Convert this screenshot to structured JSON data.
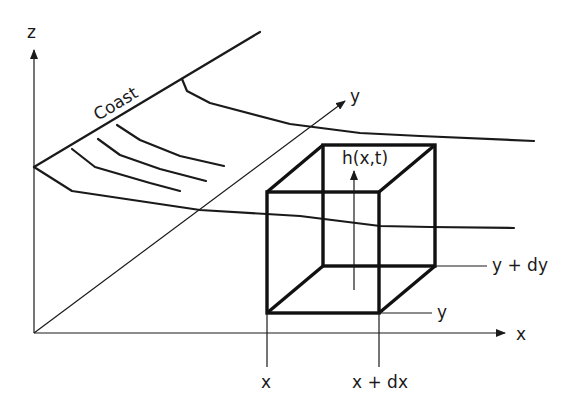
{
  "diagram": {
    "type": "control-volume-schematic",
    "axes": {
      "z_label": "z",
      "x_label": "x",
      "y_label": "y"
    },
    "coast_label": "Coast",
    "height_label": "h(x,t)",
    "cube_labels": {
      "x_left": "x",
      "x_right": "x + dx",
      "y_front": "y",
      "y_back": "y + dy"
    },
    "colors": {
      "stroke": "#1a1a1a",
      "background": "#ffffff"
    }
  }
}
